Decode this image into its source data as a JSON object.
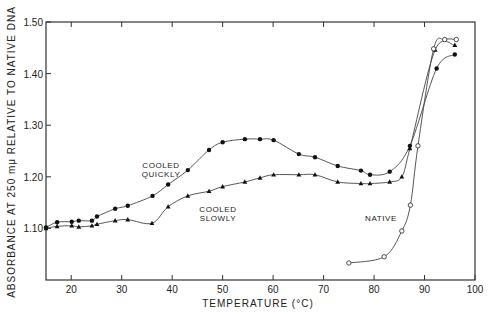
{
  "chart_data": {
    "type": "line",
    "title": "",
    "xlabel": "TEMPERATURE (°C)",
    "ylabel": "ABSORBANCE AT 250 mμ RELATIVE TO NATIVE DNA",
    "xlim": [
      15,
      100
    ],
    "ylim": [
      1.0,
      1.5
    ],
    "x_ticks": [
      20,
      30,
      40,
      50,
      60,
      70,
      80,
      90,
      100
    ],
    "y_ticks": [
      1.1,
      1.2,
      1.3,
      1.4,
      1.5
    ],
    "y_tick_labels": [
      "1.10",
      "1.20",
      "1.30",
      "1.40",
      "1.50"
    ],
    "grid": false,
    "legend": "none (inline annotations)",
    "series": [
      {
        "name": "COOLED QUICKLY",
        "label_lines": [
          "COOLED",
          "QUICKLY"
        ],
        "marker": "filled-circle",
        "points": [
          [
            15,
            1.102
          ],
          [
            17.2,
            1.112
          ],
          [
            20.1,
            1.113
          ],
          [
            21.5,
            1.115
          ],
          [
            24.1,
            1.115
          ],
          [
            25.1,
            1.123
          ],
          [
            28.7,
            1.138
          ],
          [
            31.2,
            1.144
          ],
          [
            36.1,
            1.163
          ],
          [
            39.2,
            1.185
          ],
          [
            43.1,
            1.213
          ],
          [
            47.3,
            1.252
          ],
          [
            50,
            1.267
          ],
          [
            54.4,
            1.273
          ],
          [
            57.4,
            1.273
          ],
          [
            60.1,
            1.271
          ],
          [
            65.1,
            1.244
          ],
          [
            68.3,
            1.238
          ],
          [
            72.8,
            1.221
          ],
          [
            77.4,
            1.212
          ],
          [
            79.2,
            1.204
          ],
          [
            83.1,
            1.21
          ],
          [
            87.1,
            1.26
          ],
          [
            92.4,
            1.41
          ],
          [
            96,
            1.437
          ]
        ]
      },
      {
        "name": "COOLED SLOWLY",
        "label_lines": [
          "COOLED",
          "SLOWLY"
        ],
        "marker": "filled-triangle",
        "points": [
          [
            15,
            1.1
          ],
          [
            17.2,
            1.104
          ],
          [
            20.1,
            1.105
          ],
          [
            21.5,
            1.103
          ],
          [
            24.1,
            1.105
          ],
          [
            25.1,
            1.108
          ],
          [
            28.7,
            1.115
          ],
          [
            31.2,
            1.117
          ],
          [
            36,
            1.11
          ],
          [
            39.2,
            1.142
          ],
          [
            43.1,
            1.163
          ],
          [
            47.3,
            1.172
          ],
          [
            50,
            1.181
          ],
          [
            54.4,
            1.19
          ],
          [
            57.4,
            1.198
          ],
          [
            60.1,
            1.204
          ],
          [
            65.1,
            1.204
          ],
          [
            68.3,
            1.204
          ],
          [
            72.8,
            1.19
          ],
          [
            77.4,
            1.187
          ],
          [
            79.2,
            1.187
          ],
          [
            83.1,
            1.19
          ],
          [
            85.5,
            1.2
          ],
          [
            87.1,
            1.255
          ],
          [
            92.1,
            1.446
          ],
          [
            96,
            1.455
          ]
        ]
      },
      {
        "name": "NATIVE",
        "label_lines": [
          "NATIVE"
        ],
        "marker": "open-circle",
        "points": [
          [
            75,
            1.033
          ],
          [
            82,
            1.045
          ],
          [
            85.5,
            1.095
          ],
          [
            87.2,
            1.145
          ],
          [
            88.7,
            1.26
          ],
          [
            91.8,
            1.448
          ],
          [
            94,
            1.466
          ],
          [
            96.3,
            1.466
          ]
        ]
      }
    ]
  },
  "labels": {
    "quickly_1": "COOLED",
    "quickly_2": "QUICKLY",
    "slowly_1": "COOLED",
    "slowly_2": "SLOWLY",
    "native": "NATIVE",
    "xlabel": "TEMPERATURE (°C)",
    "ylabel": "ABSORBANCE AT 250 mμ RELATIVE TO NATIVE DNA"
  }
}
